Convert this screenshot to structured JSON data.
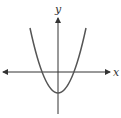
{
  "diagram": {
    "axes": {
      "x_label": "x",
      "y_label": "y",
      "arrows": [
        "left",
        "right",
        "up"
      ]
    },
    "curve": {
      "type": "parabola",
      "opens": "up",
      "vertex": "below origin on y-axis",
      "x_intercepts": 2,
      "color": "#555555"
    },
    "axis_color": "#333333"
  }
}
